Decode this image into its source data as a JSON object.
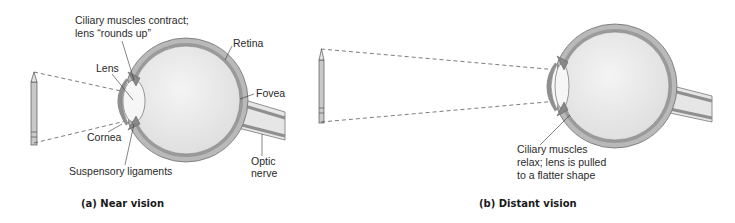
{
  "panels": [
    {
      "id": "near",
      "caption": "(a) Near vision",
      "labels": {
        "ciliary_line1": "Ciliary muscles contract;",
        "ciliary_line2": "lens “rounds up”",
        "retina": "Retina",
        "lens": "Lens",
        "fovea": "Fovea",
        "cornea": "Cornea",
        "suspensory": "Suspensory ligaments",
        "optic_line1": "Optic",
        "optic_line2": "nerve"
      }
    },
    {
      "id": "distant",
      "caption": "(b) Distant vision",
      "labels": {
        "ciliary_line1": "Ciliary muscles",
        "ciliary_line2": "relax; lens is pulled",
        "ciliary_line3": "to a flatter shape"
      }
    }
  ],
  "colors": {
    "sclera": "#b9b9b9",
    "sclera_dark": "#8f8f8f",
    "eye_interior": "#ececec",
    "lens": "#f6f6f6",
    "text": "#2a2a2a"
  }
}
